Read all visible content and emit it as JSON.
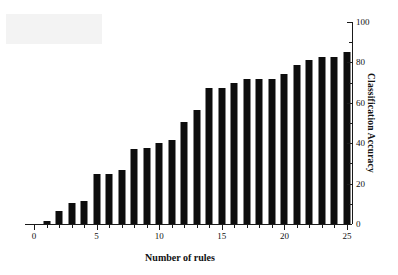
{
  "chart_data": {
    "type": "bar",
    "title": "",
    "xlabel": "Number of rules",
    "ylabel": "Classification Accuracy",
    "categories": [
      1,
      2,
      3,
      4,
      5,
      6,
      7,
      8,
      9,
      10,
      11,
      12,
      13,
      14,
      15,
      16,
      17,
      18,
      19,
      20,
      21,
      22,
      23,
      24,
      25
    ],
    "values": [
      1.5,
      6.5,
      10.5,
      11.5,
      25,
      25,
      26.5,
      37,
      37.5,
      40,
      41.5,
      50.5,
      56.5,
      67.5,
      67.5,
      70,
      72,
      72,
      72,
      74.5,
      78.5,
      81,
      82.5,
      82.5,
      85
    ],
    "xlim": [
      0,
      25
    ],
    "ylim": [
      0,
      100
    ],
    "x_ticks": [
      0,
      5,
      10,
      15,
      20,
      25
    ],
    "x_tick_labels": [
      "0",
      "5",
      "10",
      "15",
      "20",
      "25"
    ],
    "x_minor_ticks": [
      1,
      2,
      3,
      4,
      6,
      7,
      8,
      9,
      11,
      12,
      13,
      14,
      16,
      17,
      18,
      19,
      21,
      22,
      23,
      24
    ],
    "y_ticks": [
      0,
      20,
      40,
      60,
      80,
      100
    ],
    "y_tick_labels": [
      "0",
      "20",
      "40",
      "60",
      "80",
      "100"
    ],
    "y_minor_ticks": [
      10,
      30,
      50,
      70,
      90
    ],
    "y_axis_position": "right",
    "grid": false,
    "legend": null,
    "bar_color": "#0d0d0d",
    "axis_color": "#1a1a1a"
  }
}
